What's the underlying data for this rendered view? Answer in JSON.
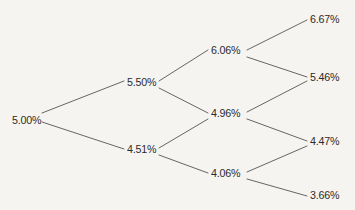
{
  "diagram": {
    "background_color": "#f6f4f1",
    "line_color": "#555555",
    "text_color": "#2b2b2b"
  },
  "chart_data": {
    "type": "diagram",
    "subtype": "binomial-tree",
    "title": "",
    "levels": [
      {
        "index": 0,
        "nodes": [
          {
            "id": "n0",
            "label": "5.00%",
            "value": 5.0,
            "x": 12,
            "y": 114
          }
        ]
      },
      {
        "index": 1,
        "nodes": [
          {
            "id": "n1u",
            "label": "5.50%",
            "value": 5.5,
            "x": 127,
            "y": 76
          },
          {
            "id": "n1d",
            "label": "4.51%",
            "value": 4.51,
            "x": 127,
            "y": 143
          }
        ]
      },
      {
        "index": 2,
        "nodes": [
          {
            "id": "n2uu",
            "label": "6.06%",
            "value": 6.06,
            "x": 211,
            "y": 44
          },
          {
            "id": "n2ud",
            "label": "4.96%",
            "value": 4.96,
            "x": 211,
            "y": 107
          },
          {
            "id": "n2dd",
            "label": "4.06%",
            "value": 4.06,
            "x": 211,
            "y": 167
          }
        ]
      },
      {
        "index": 3,
        "nodes": [
          {
            "id": "n3uuu",
            "label": "6.67%",
            "value": 6.67,
            "x": 310,
            "y": 13
          },
          {
            "id": "n3uud",
            "label": "5.46%",
            "value": 5.46,
            "x": 310,
            "y": 71
          },
          {
            "id": "n3udd",
            "label": "4.47%",
            "value": 4.47,
            "x": 310,
            "y": 135
          },
          {
            "id": "n3ddd",
            "label": "3.66%",
            "value": 3.66,
            "x": 310,
            "y": 189
          }
        ]
      }
    ],
    "edges": [
      {
        "from": "n0",
        "to": "n1u",
        "x1": 42,
        "y1": 113,
        "x2": 124,
        "y2": 81
      },
      {
        "from": "n0",
        "to": "n1d",
        "x1": 42,
        "y1": 122,
        "x2": 124,
        "y2": 149
      },
      {
        "from": "n1u",
        "to": "n2uu",
        "x1": 159,
        "y1": 81,
        "x2": 208,
        "y2": 50
      },
      {
        "from": "n1u",
        "to": "n2ud",
        "x1": 159,
        "y1": 88,
        "x2": 208,
        "y2": 113
      },
      {
        "from": "n1d",
        "to": "n2ud",
        "x1": 159,
        "y1": 148,
        "x2": 208,
        "y2": 119
      },
      {
        "from": "n1d",
        "to": "n2dd",
        "x1": 159,
        "y1": 155,
        "x2": 208,
        "y2": 173
      },
      {
        "from": "n2uu",
        "to": "n3uuu",
        "x1": 247,
        "y1": 50,
        "x2": 307,
        "y2": 20
      },
      {
        "from": "n2uu",
        "to": "n3uud",
        "x1": 247,
        "y1": 57,
        "x2": 307,
        "y2": 77
      },
      {
        "from": "n2ud",
        "to": "n3uud",
        "x1": 247,
        "y1": 112,
        "x2": 307,
        "y2": 81
      },
      {
        "from": "n2ud",
        "to": "n3udd",
        "x1": 247,
        "y1": 119,
        "x2": 307,
        "y2": 141
      },
      {
        "from": "n2dd",
        "to": "n3udd",
        "x1": 247,
        "y1": 172,
        "x2": 307,
        "y2": 146
      },
      {
        "from": "n2dd",
        "to": "n3ddd",
        "x1": 247,
        "y1": 179,
        "x2": 307,
        "y2": 196
      }
    ]
  }
}
